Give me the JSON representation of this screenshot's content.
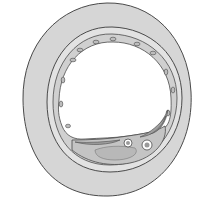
{
  "diagram": {
    "layers": [
      {
        "name": "outer-wall",
        "color": "#d6d6d6"
      },
      {
        "name": "inner-wall",
        "color": "#e2e2e2"
      },
      {
        "name": "endothelium",
        "color": "#cfcfcf"
      },
      {
        "name": "lumen",
        "color": "#ffffff"
      },
      {
        "name": "plaque",
        "color": "#c4c4c4"
      }
    ],
    "colors": {
      "outline": "#4a4a4a",
      "background": "#ffffff"
    }
  }
}
